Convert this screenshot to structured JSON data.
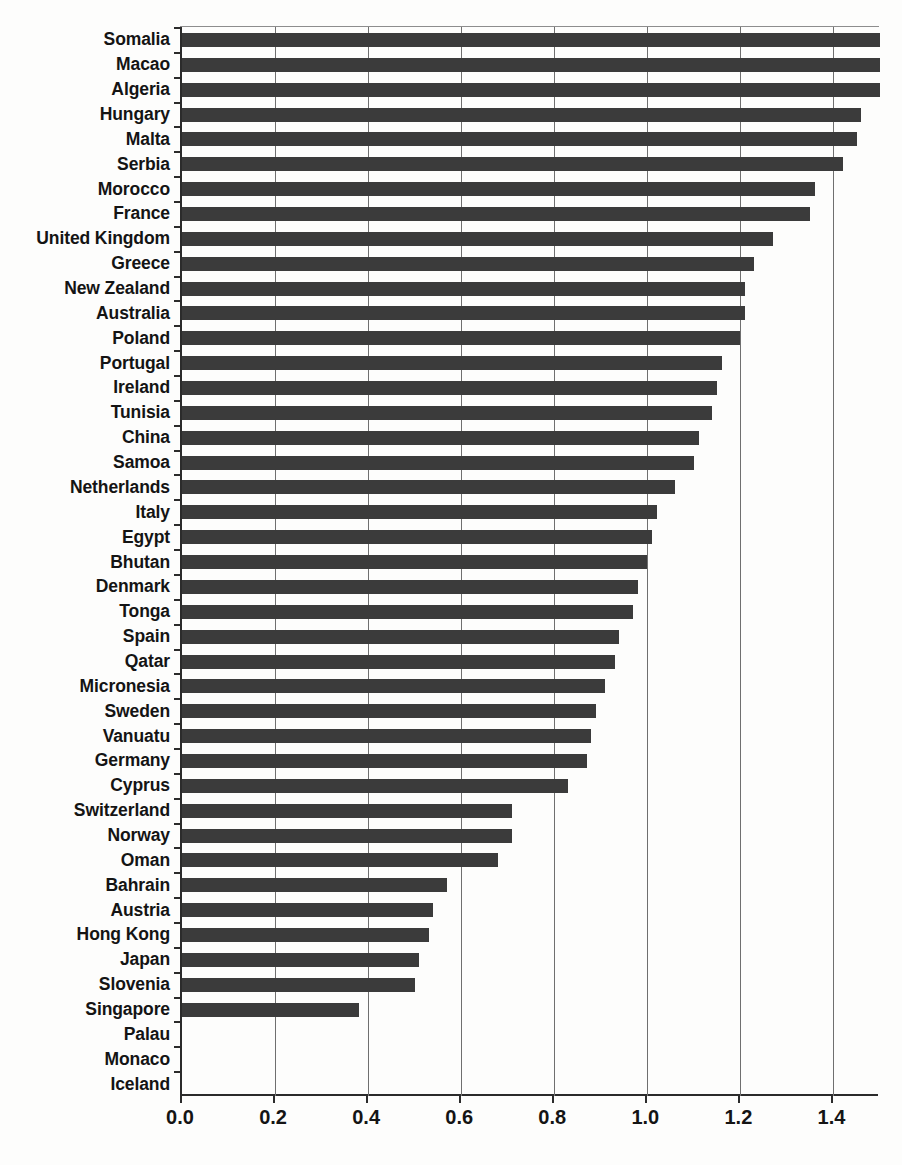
{
  "chart_data": {
    "type": "bar",
    "orientation": "horizontal",
    "title": "",
    "subtitle": "",
    "xlabel": "",
    "ylabel": "",
    "xlim": [
      0.0,
      1.5
    ],
    "xticks": [
      "0.0",
      "0.2",
      "0.4",
      "0.6",
      "0.8",
      "1.0",
      "1.2",
      "1.4"
    ],
    "xtick_values": [
      0.0,
      0.2,
      0.4,
      0.6,
      0.8,
      1.0,
      1.2,
      1.4
    ],
    "grid": "vertical",
    "legend": "none",
    "bar_color": "#3b3b3b",
    "categories": [
      "Somalia",
      "Macao",
      "Algeria",
      "Hungary",
      "Malta",
      "Serbia",
      "Morocco",
      "France",
      "United Kingdom",
      "Greece",
      "New Zealand",
      "Australia",
      "Poland",
      "Portugal",
      "Ireland",
      "Tunisia",
      "China",
      "Samoa",
      "Netherlands",
      "Italy",
      "Egypt",
      "Bhutan",
      "Denmark",
      "Tonga",
      "Spain",
      "Qatar",
      "Micronesia",
      "Sweden",
      "Vanuatu",
      "Germany",
      "Cyprus",
      "Switzerland",
      "Norway",
      "Oman",
      "Bahrain",
      "Austria",
      "Hong Kong",
      "Japan",
      "Slovenia",
      "Singapore",
      "Palau",
      "Monaco",
      "Iceland"
    ],
    "values": [
      1.5,
      1.5,
      1.5,
      1.46,
      1.45,
      1.42,
      1.36,
      1.35,
      1.27,
      1.23,
      1.21,
      1.21,
      1.2,
      1.16,
      1.15,
      1.14,
      1.11,
      1.1,
      1.06,
      1.02,
      1.01,
      1.0,
      0.98,
      0.97,
      0.94,
      0.93,
      0.91,
      0.89,
      0.88,
      0.87,
      0.83,
      0.71,
      0.71,
      0.68,
      0.57,
      0.54,
      0.53,
      0.51,
      0.5,
      0.38,
      0.0,
      0.0,
      0.0
    ]
  }
}
